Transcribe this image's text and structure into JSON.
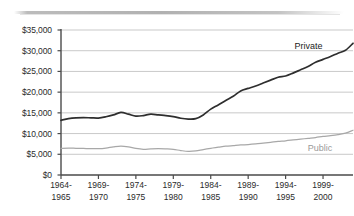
{
  "chart_data": {
    "type": "line",
    "title": "",
    "subtitle": "",
    "xlabel": "",
    "ylabel": "",
    "ylim": [
      0,
      35000
    ],
    "ytick_values": [
      0,
      5000,
      10000,
      15000,
      20000,
      25000,
      30000,
      35000
    ],
    "ytick_labels": [
      "$0",
      "$5,000",
      "$10,000",
      "$15,000",
      "$20,000",
      "$25,000",
      "$30,000",
      "$35,000"
    ],
    "xtick_labels": [
      "1964-\n1965",
      "1969-\n1970",
      "1974-\n1975",
      "1979-\n1980",
      "1984-\n1985",
      "1989-\n1990",
      "1994-\n1995",
      "1999-\n2000"
    ],
    "xtick_labels_line1": [
      "1964-",
      "1969-",
      "1974-",
      "1979-",
      "1984-",
      "1989-",
      "1994-",
      "1999-"
    ],
    "xtick_labels_line2": [
      "1965",
      "1970",
      "1975",
      "1980",
      "1985",
      "1990",
      "1995",
      "2000"
    ],
    "xtick_positions_fraction": [
      0.0,
      0.1282,
      0.2564,
      0.3846,
      0.5128,
      0.641,
      0.7692,
      0.8974
    ],
    "grid": true,
    "grid_orientation": "horizontal",
    "legend": "inline-series-labels",
    "legend_position": "right-inline",
    "colors": {
      "private_line": "#2e2e2e",
      "public_line": "#a8a8a8",
      "gridline": "#c9c9c9",
      "axis": "#4a4a4a",
      "background": "#ffffff",
      "private_label": "#1c1c1c",
      "public_label": "#9a9a9a"
    },
    "x": [
      "1964-1965",
      "1965-1966",
      "1966-1967",
      "1967-1968",
      "1968-1969",
      "1969-1970",
      "1970-1971",
      "1971-1972",
      "1972-1973",
      "1973-1974",
      "1974-1975",
      "1975-1976",
      "1976-1977",
      "1977-1978",
      "1978-1979",
      "1979-1980",
      "1980-1981",
      "1981-1982",
      "1982-1983",
      "1983-1984",
      "1984-1985",
      "1985-1986",
      "1986-1987",
      "1987-1988",
      "1988-1989",
      "1989-1990",
      "1990-1991",
      "1991-1992",
      "1992-1993",
      "1993-1994",
      "1994-1995",
      "1995-1996",
      "1996-1997",
      "1997-1998",
      "1998-1999",
      "1999-2000",
      "2000-2001",
      "2001-2002",
      "2002-2003",
      "2003-2004"
    ],
    "series": [
      {
        "name": "Private",
        "color": "#2e2e2e",
        "label": "Private",
        "values": [
          13200,
          13600,
          13800,
          13850,
          13800,
          13750,
          14050,
          14500,
          15100,
          14700,
          14200,
          14350,
          14700,
          14500,
          14350,
          14100,
          13700,
          13500,
          13600,
          14500,
          15900,
          16900,
          18000,
          19000,
          20300,
          20900,
          21500,
          22200,
          22900,
          23600,
          23900,
          24600,
          25400,
          26200,
          27200,
          27900,
          28600,
          29400,
          30100,
          31800
        ]
      },
      {
        "name": "Public",
        "color": "#a8a8a8",
        "label": "Public",
        "values": [
          6400,
          6500,
          6450,
          6400,
          6350,
          6350,
          6500,
          6800,
          7000,
          6800,
          6400,
          6200,
          6300,
          6350,
          6300,
          6200,
          5900,
          5700,
          5800,
          6150,
          6450,
          6700,
          6950,
          7100,
          7250,
          7350,
          7500,
          7700,
          7900,
          8100,
          8250,
          8450,
          8650,
          8850,
          9050,
          9300,
          9500,
          9750,
          10100,
          10800
        ]
      }
    ],
    "annotations": [
      {
        "text": "Private",
        "series": "Private",
        "x_fraction": 0.8,
        "y_value": 31000
      },
      {
        "text": "Public",
        "series": "Public",
        "x_fraction": 0.845,
        "y_value": 6200
      }
    ]
  }
}
